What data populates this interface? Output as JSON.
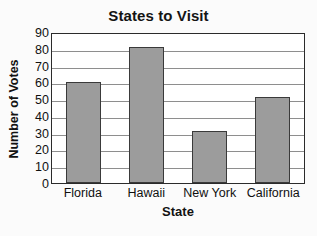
{
  "chart_data": {
    "type": "bar",
    "title": "States to Visit",
    "xlabel": "State",
    "ylabel": "Number of Votes",
    "categories": [
      "Florida",
      "Hawaii",
      "New York",
      "California"
    ],
    "values": [
      60,
      81,
      31,
      51
    ],
    "ylim": [
      0,
      90
    ],
    "ytick_step": 10,
    "yticks": [
      90,
      80,
      70,
      60,
      50,
      40,
      30,
      20,
      10,
      0
    ],
    "grid": "horizontal",
    "legend": "none",
    "colors": {
      "bar_fill": "#9c9c9c",
      "bar_edge": "#3a3a3a",
      "axis": "#2b2b2b",
      "gridline": "#8e8e8e",
      "plot_background": "#ffffff",
      "figure_background": "#fbfbfb",
      "text": "#101010"
    }
  }
}
